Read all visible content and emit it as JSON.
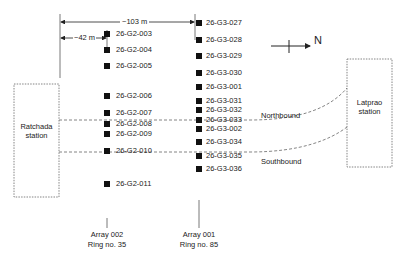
{
  "dimensions": {
    "total": "~103 m",
    "partial": "~42 m"
  },
  "north_arrow": {
    "label": "N"
  },
  "stations": [
    {
      "name": "Ratchada",
      "line2": "station"
    },
    {
      "name": "Latprao",
      "line2": "station"
    }
  ],
  "tracks": [
    {
      "label": "Northbound"
    },
    {
      "label": "Southbound"
    }
  ],
  "array_002": {
    "caption": "Array 002",
    "ring": "Ring no. 35",
    "points": [
      {
        "id": "26-G2-003",
        "y": 34
      },
      {
        "id": "26-G2-004",
        "y": 50
      },
      {
        "id": "26-G2-005",
        "y": 66
      },
      {
        "id": "26-G2-006",
        "y": 96
      },
      {
        "id": "26-G2-007",
        "y": 113
      },
      {
        "id": "26-G2-008",
        "y": 124
      },
      {
        "id": "26-G2-009",
        "y": 134
      },
      {
        "id": "26-G2-010",
        "y": 151
      },
      {
        "id": "26-G2-011",
        "y": 184
      }
    ]
  },
  "array_001": {
    "caption": "Array 001",
    "ring": "Ring no. 85",
    "points": [
      {
        "id": "26-G3-027",
        "y": 23
      },
      {
        "id": "26-G3-028",
        "y": 40
      },
      {
        "id": "26-G3-029",
        "y": 56
      },
      {
        "id": "26-G3-030",
        "y": 73
      },
      {
        "id": "26-G3-001",
        "y": 87
      },
      {
        "id": "26-G3-031",
        "y": 101
      },
      {
        "id": "26-G3-032",
        "y": 110
      },
      {
        "id": "26-G3-033",
        "y": 120
      },
      {
        "id": "26-G3-002",
        "y": 129
      },
      {
        "id": "26-G3-034",
        "y": 142
      },
      {
        "id": "26-G3-035",
        "y": 156
      },
      {
        "id": "26-G3-036",
        "y": 169
      }
    ]
  }
}
